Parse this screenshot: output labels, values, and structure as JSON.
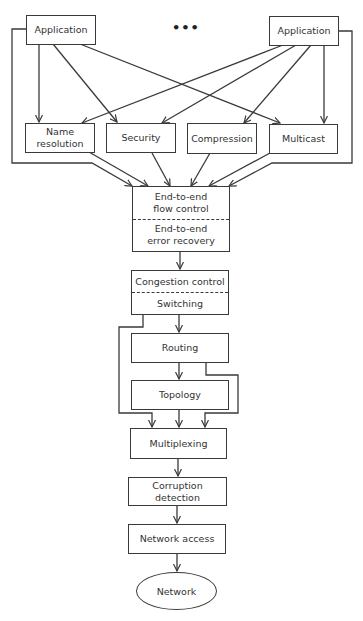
{
  "diagram": {
    "title": "",
    "ellipsis": "•••",
    "nodes": {
      "app_left": "Application",
      "app_right": "Application",
      "name_res_l1": "Name",
      "name_res_l2": "resolution",
      "security": "Security",
      "compression": "Compression",
      "multicast": "Multicast",
      "e2e_flow_l1": "End-to-end",
      "e2e_flow_l2": "flow control",
      "e2e_err_l1": "End-to-end",
      "e2e_err_l2": "error recovery",
      "congestion": "Congestion control",
      "switching": "Switching",
      "routing": "Routing",
      "topology": "Topology",
      "multiplexing": "Multiplexing",
      "corruption": "Corruption detection",
      "net_access": "Network access",
      "network": "Network"
    },
    "colors": {
      "stroke": "#3a3a3a",
      "text": "#333333",
      "background": "#ffffff"
    }
  }
}
